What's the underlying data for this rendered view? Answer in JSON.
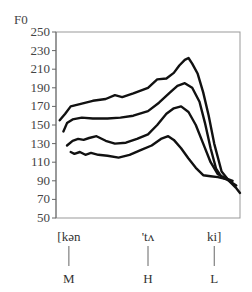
{
  "chart_data": {
    "type": "line",
    "title": "",
    "ylabel": "F0",
    "xlabel": "",
    "ylim": [
      50,
      250
    ],
    "xlim": [
      0,
      100
    ],
    "yticks": [
      50,
      70,
      90,
      110,
      130,
      150,
      170,
      190,
      210,
      230,
      250
    ],
    "grid": false,
    "legend": "none",
    "colors": {
      "line": "#111111",
      "axis": "#777777",
      "text": "#444444"
    },
    "segments": [
      {
        "syllable": "[kən",
        "tone": "M",
        "x": 7
      },
      {
        "syllable": "'tʌ",
        "tone": "H",
        "x": 50
      },
      {
        "syllable": "ki]",
        "tone": "L",
        "x": 86
      }
    ],
    "series": [
      {
        "name": "contour-1",
        "x": [
          2,
          5,
          8,
          14,
          20,
          27,
          32,
          36,
          42,
          50,
          55,
          60,
          64,
          67,
          70,
          72,
          74,
          77,
          80,
          83,
          86,
          90,
          94,
          98,
          100
        ],
        "y": [
          155,
          162,
          170,
          173,
          176,
          178,
          182,
          180,
          184,
          190,
          199,
          200,
          206,
          214,
          220,
          222,
          216,
          205,
          185,
          160,
          130,
          100,
          90,
          82,
          77
        ]
      },
      {
        "name": "contour-2",
        "x": [
          4,
          6,
          9,
          14,
          20,
          28,
          35,
          42,
          50,
          56,
          62,
          66,
          70,
          74,
          78,
          81,
          84,
          87,
          90,
          94,
          98
        ],
        "y": [
          143,
          152,
          156,
          158,
          157,
          157,
          158,
          160,
          165,
          174,
          185,
          192,
          195,
          190,
          175,
          152,
          125,
          103,
          94,
          90,
          85
        ]
      },
      {
        "name": "contour-3",
        "x": [
          6,
          9,
          12,
          15,
          18,
          22,
          27,
          32,
          38,
          44,
          50,
          55,
          60,
          64,
          68,
          72,
          76,
          80,
          84,
          88,
          92,
          96
        ],
        "y": [
          128,
          133,
          135,
          134,
          136,
          138,
          133,
          130,
          131,
          135,
          140,
          150,
          162,
          168,
          170,
          164,
          150,
          130,
          110,
          97,
          93,
          90
        ]
      },
      {
        "name": "contour-4",
        "x": [
          8,
          10,
          13,
          16,
          19,
          23,
          28,
          34,
          40,
          46,
          52,
          57,
          61,
          64,
          68,
          72,
          76,
          80,
          84,
          88,
          92
        ],
        "y": [
          121,
          119,
          121,
          118,
          120,
          118,
          117,
          115,
          118,
          123,
          128,
          135,
          138,
          134,
          125,
          114,
          104,
          96,
          95,
          94,
          92
        ]
      }
    ]
  }
}
